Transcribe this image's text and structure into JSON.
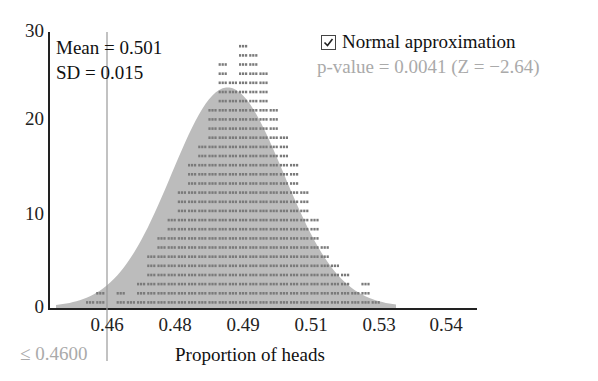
{
  "chart_data": {
    "type": "scatter",
    "subtype": "dotplot-with-normal-overlay",
    "title": "",
    "xlabel": "Proportion of heads",
    "ylabel": "",
    "xticks": [
      "0.46",
      "0.48",
      "0.49",
      "0.51",
      "0.53",
      "0.54"
    ],
    "yticks": [
      "0",
      "10",
      "20",
      "30"
    ],
    "ylim": [
      0,
      30
    ],
    "xlim": [
      0.45,
      0.55
    ],
    "stats": {
      "mean": 0.501,
      "sd": 0.015
    },
    "cutoff": {
      "value": 0.46,
      "label": "≤ 0.4600"
    },
    "normal_approximation": {
      "checked": true,
      "p_value": 0.0041,
      "z": -2.64
    },
    "bins_x": [
      0.455,
      0.458,
      0.461,
      0.464,
      0.467,
      0.47,
      0.473,
      0.476,
      0.479,
      0.482,
      0.485,
      0.488,
      0.491,
      0.494,
      0.497,
      0.5,
      0.503,
      0.506,
      0.509,
      0.512,
      0.515,
      0.518,
      0.521,
      0.524,
      0.527,
      0.53,
      0.533,
      0.536,
      0.539,
      0.542
    ],
    "counts": [
      1,
      2,
      0,
      2,
      1,
      3,
      6,
      8,
      10,
      13,
      16,
      18,
      22,
      27,
      25,
      29,
      28,
      26,
      22,
      19,
      16,
      13,
      10,
      7,
      5,
      4,
      2,
      3,
      1,
      0
    ],
    "grid": false,
    "legend_position": "top-right"
  },
  "labels": {
    "mean": "Mean = 0.501",
    "sd": "SD = 0.015",
    "normal_checkbox": "Normal approximation",
    "p_value": "p-value = 0.0041 (Z = −2.64)",
    "cutoff": "≤ 0.4600",
    "xlabel": "Proportion of heads",
    "y0": "0",
    "y10": "10",
    "y20": "20",
    "y30": "30",
    "x046": "0.46",
    "x048": "0.48",
    "x049": "0.49",
    "x051": "0.51",
    "x053": "0.53",
    "x054": "0.54"
  },
  "colors": {
    "dots": "#7a7a7a",
    "curve_fill": "#b9b9b9",
    "axis": "#222222",
    "muted_text": "#aaaaaa"
  }
}
